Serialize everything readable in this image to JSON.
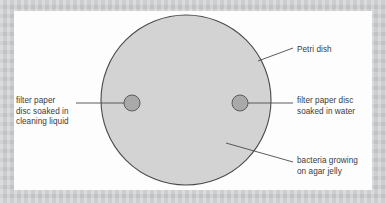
{
  "figure": {
    "background_color": "#c8c9cb",
    "panel_color": "#fdfdfd",
    "dish_fill_color": "#d2d2d2",
    "dish_stroke_color": "#4d4d4d",
    "disc_fill_color": "#a8a8a8",
    "disc_stroke_color": "#5a5a5a",
    "leader_line_color": "#4d4d4d",
    "text_color": "#3b3b3b"
  },
  "labels": {
    "petri_dish": "Petri dish",
    "filter_paper_cleaning": "filter paper\ndisc soaked in\ncleaning liquid",
    "filter_paper_water": "filter paper disc\nsoaked in water",
    "bacteria": "bacteria growing\non agar jelly"
  },
  "geometry": {
    "dish_center_x": 186,
    "dish_center_y": 100,
    "dish_radius": 85,
    "disc_left_center_x": 132,
    "disc_left_center_y": 103,
    "disc_right_center_x": 240,
    "disc_right_center_y": 103,
    "disc_radius": 8
  }
}
